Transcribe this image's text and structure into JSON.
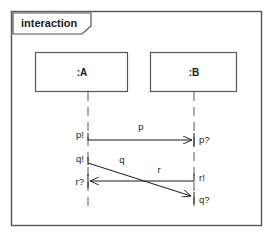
{
  "frame": {
    "label": "interaction",
    "x": 11,
    "y": 11,
    "width": 251,
    "height": 215,
    "border_color": "#555555",
    "tab": {
      "x": 13,
      "y": 13,
      "width": 78,
      "height": 21,
      "notch": 9
    }
  },
  "lifelines": [
    {
      "id": "A",
      "name": ":A",
      "box": {
        "x": 35,
        "y": 52,
        "width": 93,
        "height": 40
      },
      "line_x": 88,
      "line_top": 92,
      "line_bottom": 212
    },
    {
      "id": "B",
      "name": ":B",
      "box": {
        "x": 150,
        "y": 52,
        "width": 87,
        "height": 40
      },
      "line_x": 194,
      "line_top": 92,
      "line_bottom": 212
    }
  ],
  "messages": [
    {
      "name": "p",
      "label": "p",
      "label_x": 141,
      "label_y": 130,
      "from": "A",
      "to": "B",
      "x1": 88,
      "y1": 140,
      "x2": 194,
      "y2": 140,
      "send_event": "p!",
      "send_x": 84,
      "send_y": 137,
      "receive_event": "p?",
      "receive_x": 198,
      "receive_y": 141
    },
    {
      "name": "q",
      "label": "q",
      "label_x": 121,
      "label_y": 160,
      "from": "A",
      "to": "B",
      "x1": 88,
      "y1": 163,
      "x2": 194,
      "y2": 197,
      "send_event": "q!",
      "send_x": 84,
      "send_y": 160,
      "receive_event": "q?",
      "receive_x": 198,
      "receive_y": 201
    },
    {
      "name": "r",
      "label": "r",
      "label_x": 158,
      "label_y": 171,
      "from": "B",
      "to": "A",
      "x1": 194,
      "y1": 181,
      "x2": 88,
      "y2": 181,
      "send_event": "r!",
      "send_x": 198,
      "send_y": 180,
      "receive_event": "r?",
      "receive_x": 84,
      "receive_y": 184
    }
  ],
  "colors": {
    "stroke": "#1a1a1a",
    "frame_stroke": "#555555",
    "box_stroke": "#555555",
    "lifeline_stroke": "#888888",
    "background": "#ffffff"
  }
}
